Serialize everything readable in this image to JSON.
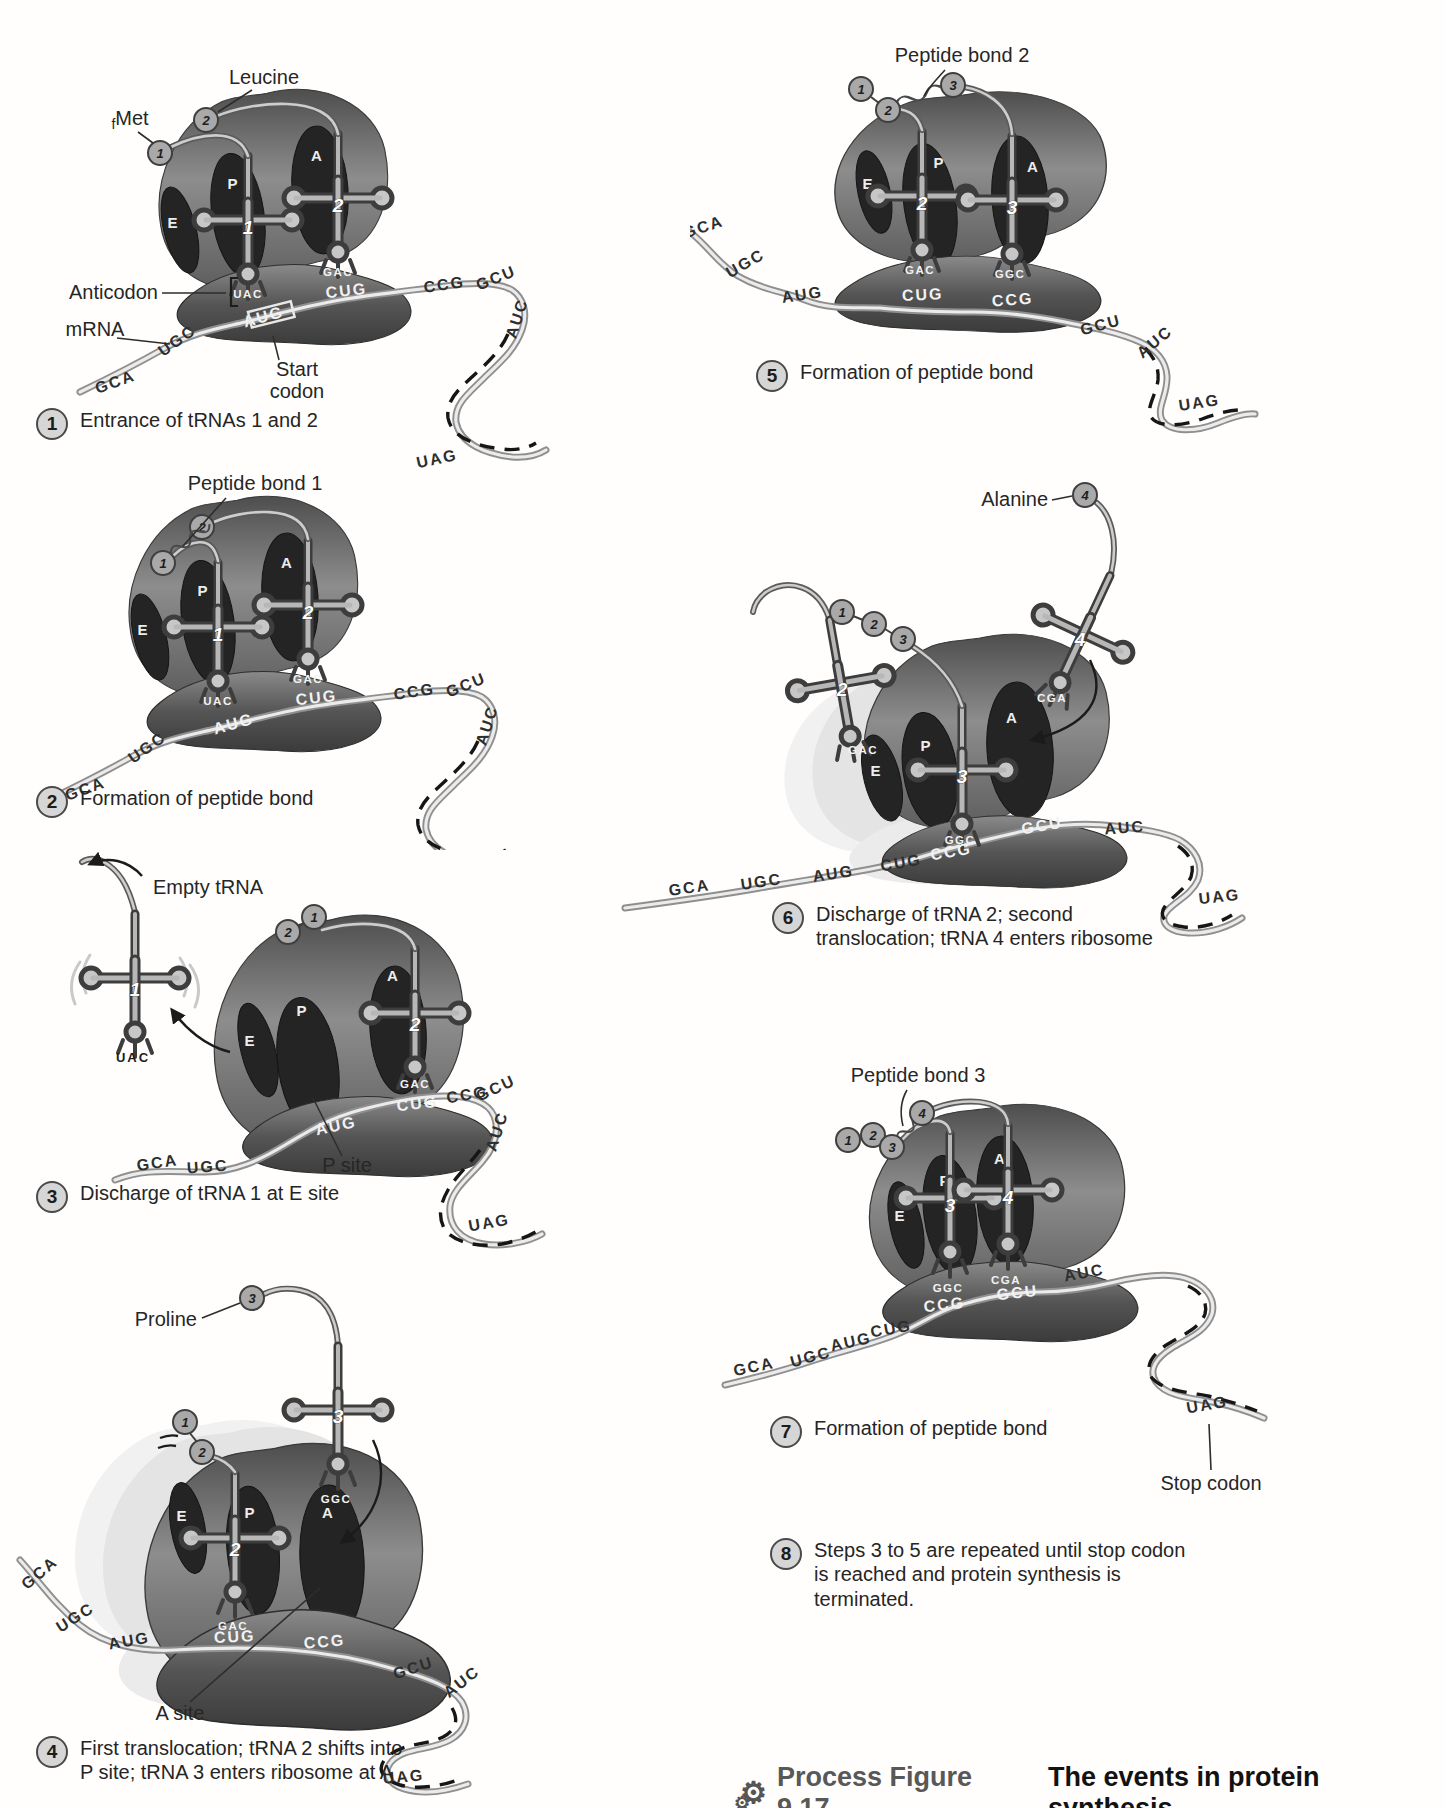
{
  "figure": {
    "icon": "process-gears-icon",
    "label": "Process Figure 9.17",
    "text": "The events in protein synthesis."
  },
  "shared": {
    "sites": {
      "e": "E",
      "p": "P",
      "a": "A"
    },
    "codons": {
      "c1": "GCA",
      "c2": "UGC",
      "c3": "AUG",
      "c4": "CUG",
      "c5": "CCG",
      "c6": "GCU",
      "c7": "AUC",
      "c8": "UAG"
    },
    "anticodons": {
      "t1": "UAC",
      "t2": "GAC",
      "t3": "GGC",
      "t4": "CGA"
    },
    "trna": {
      "t1": "1",
      "t2": "2",
      "t3": "3",
      "t4": "4"
    },
    "amino": {
      "a1": "1",
      "a2": "2",
      "a3": "3",
      "a4": "4"
    }
  },
  "panels": {
    "p1": {
      "labels": {
        "leucine": "Leucine",
        "fmet_f": "f",
        "fmet_rest": "Met",
        "anticodon": "Anticodon",
        "mrna": "mRNA",
        "start1": "Start",
        "start2": "codon"
      }
    },
    "p2": {
      "labels": {
        "peptide_bond": "Peptide bond 1"
      }
    },
    "p3": {
      "labels": {
        "empty_trna": "Empty tRNA",
        "p_site": "P site"
      }
    },
    "p4": {
      "labels": {
        "proline": "Proline",
        "a_site": "A site"
      }
    },
    "p5": {
      "labels": {
        "peptide_bond": "Peptide bond 2"
      }
    },
    "p6": {
      "labels": {
        "alanine": "Alanine"
      }
    },
    "p7": {
      "labels": {
        "peptide_bond": "Peptide bond 3",
        "stop_codon": "Stop codon"
      }
    }
  },
  "steps": {
    "s1": {
      "num": "1",
      "line1": "Entrance of tRNAs 1 and 2"
    },
    "s2": {
      "num": "2",
      "line1": "Formation of peptide bond"
    },
    "s3": {
      "num": "3",
      "line1": "Discharge of tRNA 1 at E site"
    },
    "s4": {
      "num": "4",
      "line1": "First translocation; tRNA 2 shifts into",
      "line2": "P site; tRNA 3 enters ribosome at A"
    },
    "s5": {
      "num": "5",
      "line1": "Formation of peptide bond"
    },
    "s6": {
      "num": "6",
      "line1": "Discharge of tRNA 2; second",
      "line2": "translocation; tRNA 4 enters ribosome"
    },
    "s7": {
      "num": "7",
      "line1": "Formation of peptide bond"
    },
    "s8": {
      "num": "8",
      "line1": "Steps 3 to 5 are repeated until stop codon",
      "line2": "is reached and protein synthesis is",
      "line3": "terminated."
    }
  }
}
